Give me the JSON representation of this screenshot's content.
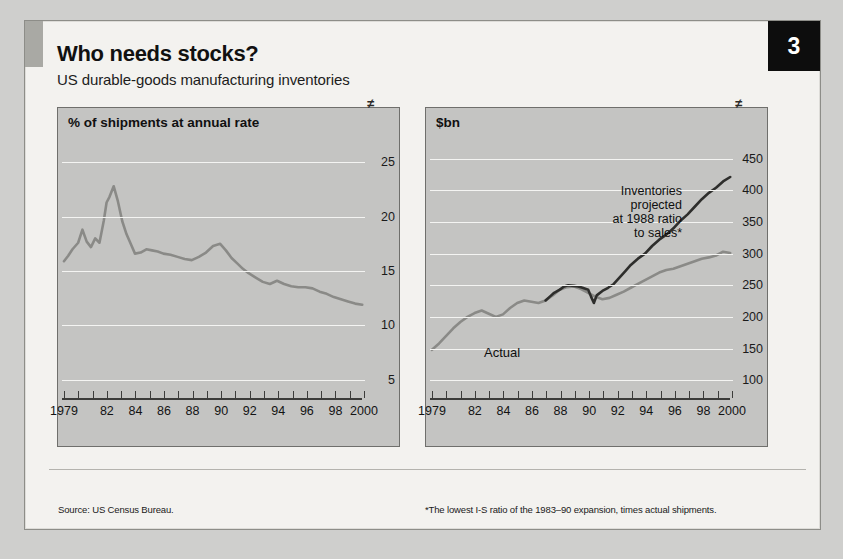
{
  "header": {
    "badge_number": "3",
    "title": "Who needs stocks?",
    "subtitle": "US durable-goods manufacturing inventories"
  },
  "footnotes": {
    "source": "Source: US Census Bureau.",
    "note": "*The lowest I-S ratio of the 1983–90 expansion, times actual shipments."
  },
  "colors": {
    "panel_background": "#c4c4c2",
    "card_background": "#f3f2ef",
    "actual_line": "#8a8a87",
    "projected_line": "#2e2e2c",
    "gridline": "#f4f4f2",
    "badge": "#0d0d0d",
    "accent_bar": "#a9a9a4"
  },
  "chart_data": [
    {
      "type": "line",
      "panel": "left",
      "title": "% of shipments at annual rate",
      "xlabel": "",
      "ylabel": "% of shipments at annual rate",
      "xlim": [
        1979,
        2000
      ],
      "ylim": [
        3.5,
        26.5
      ],
      "yticks": [
        5,
        10,
        15,
        20,
        25
      ],
      "xticks": [
        1979,
        1980,
        1981,
        1982,
        1983,
        1984,
        1985,
        1986,
        1987,
        1988,
        1989,
        1990,
        1991,
        1992,
        1993,
        1994,
        1995,
        1996,
        1997,
        1998,
        1999,
        2000
      ],
      "xticklabels": [
        "1979",
        "",
        "",
        "82",
        "",
        "84",
        "",
        "86",
        "",
        "88",
        "",
        "90",
        "",
        "92",
        "",
        "94",
        "",
        "96",
        "",
        "98",
        "",
        "2000"
      ],
      "grid": true,
      "axis_break_right": true,
      "series": [
        {
          "name": "Inventories as % of shipments",
          "color": "#8a8a87",
          "x": [
            1979.0,
            1979.3,
            1979.6,
            1980.0,
            1980.3,
            1980.6,
            1980.9,
            1981.2,
            1981.5,
            1981.8,
            1982.0,
            1982.2,
            1982.5,
            1982.8,
            1983.1,
            1983.4,
            1983.7,
            1984.0,
            1984.4,
            1984.8,
            1985.2,
            1985.6,
            1986.0,
            1986.5,
            1987.0,
            1987.5,
            1988.0,
            1988.5,
            1989.0,
            1989.5,
            1990.0,
            1990.4,
            1990.8,
            1991.2,
            1991.6,
            1992.0,
            1992.5,
            1993.0,
            1993.5,
            1994.0,
            1994.5,
            1995.0,
            1995.5,
            1996.0,
            1996.5,
            1997.0,
            1997.5,
            1998.0,
            1998.5,
            1999.0,
            1999.5,
            2000.0
          ],
          "y": [
            15.9,
            16.4,
            17.0,
            17.6,
            18.8,
            17.7,
            17.2,
            18.0,
            17.6,
            19.6,
            21.3,
            21.8,
            22.8,
            21.4,
            19.6,
            18.4,
            17.5,
            16.6,
            16.7,
            17.0,
            16.9,
            16.8,
            16.6,
            16.5,
            16.3,
            16.1,
            16.0,
            16.3,
            16.7,
            17.3,
            17.5,
            16.9,
            16.2,
            15.7,
            15.2,
            14.8,
            14.4,
            14.0,
            13.8,
            14.1,
            13.8,
            13.6,
            13.5,
            13.5,
            13.4,
            13.1,
            12.9,
            12.6,
            12.4,
            12.2,
            12.0,
            11.9
          ]
        }
      ]
    },
    {
      "type": "line",
      "panel": "right",
      "title": "$bn",
      "xlabel": "",
      "ylabel": "$bn",
      "xlim": [
        1979,
        2000
      ],
      "ylim": [
        75,
        470
      ],
      "yticks": [
        100,
        150,
        200,
        250,
        300,
        350,
        400,
        450
      ],
      "xticks": [
        1979,
        1980,
        1981,
        1982,
        1983,
        1984,
        1985,
        1986,
        1987,
        1988,
        1989,
        1990,
        1991,
        1992,
        1993,
        1994,
        1995,
        1996,
        1997,
        1998,
        1999,
        2000
      ],
      "xticklabels": [
        "1979",
        "",
        "",
        "82",
        "",
        "84",
        "",
        "86",
        "",
        "88",
        "",
        "90",
        "",
        "92",
        "",
        "94",
        "",
        "96",
        "",
        "98",
        "",
        "2000"
      ],
      "grid": true,
      "axis_break_right": true,
      "annotations": [
        {
          "name": "projected-label",
          "lines": [
            "Inventories",
            "projected",
            "at 1988 ratio",
            "to sales*"
          ]
        },
        {
          "name": "actual-label",
          "lines": [
            "Actual"
          ]
        }
      ],
      "series": [
        {
          "name": "Actual",
          "color": "#8a8a87",
          "x": [
            1979.0,
            1979.5,
            1980.0,
            1980.5,
            1981.0,
            1981.5,
            1982.0,
            1982.5,
            1983.0,
            1983.5,
            1984.0,
            1984.5,
            1985.0,
            1985.5,
            1986.0,
            1986.5,
            1987.0,
            1987.5,
            1988.0,
            1988.5,
            1989.0,
            1989.5,
            1990.0,
            1990.5,
            1991.0,
            1991.5,
            1992.0,
            1992.5,
            1993.0,
            1993.5,
            1994.0,
            1994.5,
            1995.0,
            1995.5,
            1996.0,
            1996.5,
            1997.0,
            1997.5,
            1998.0,
            1998.5,
            1999.0,
            1999.5,
            2000.0
          ],
          "y": [
            148,
            158,
            170,
            182,
            192,
            200,
            206,
            210,
            205,
            200,
            204,
            214,
            222,
            226,
            224,
            222,
            226,
            234,
            243,
            247,
            248,
            244,
            238,
            232,
            228,
            230,
            235,
            240,
            246,
            252,
            258,
            264,
            270,
            274,
            276,
            280,
            284,
            288,
            292,
            294,
            297,
            303,
            301
          ]
        },
        {
          "name": "Inventories projected at 1988 ratio to sales",
          "color": "#2e2e2c",
          "x": [
            1987.0,
            1987.3,
            1987.6,
            1988.0,
            1988.3,
            1988.6,
            1989.0,
            1989.3,
            1989.6,
            1990.0,
            1990.2,
            1990.4,
            1990.6,
            1991.0,
            1991.4,
            1991.8,
            1992.2,
            1992.6,
            1993.0,
            1993.5,
            1994.0,
            1994.5,
            1995.0,
            1995.5,
            1996.0,
            1996.5,
            1997.0,
            1997.5,
            1998.0,
            1998.5,
            1999.0,
            1999.5,
            2000.0
          ],
          "y": [
            226,
            232,
            238,
            243,
            248,
            250,
            249,
            248,
            246,
            243,
            232,
            222,
            234,
            241,
            246,
            252,
            262,
            272,
            282,
            292,
            300,
            312,
            322,
            330,
            340,
            352,
            362,
            374,
            386,
            396,
            404,
            414,
            421
          ]
        }
      ]
    }
  ]
}
